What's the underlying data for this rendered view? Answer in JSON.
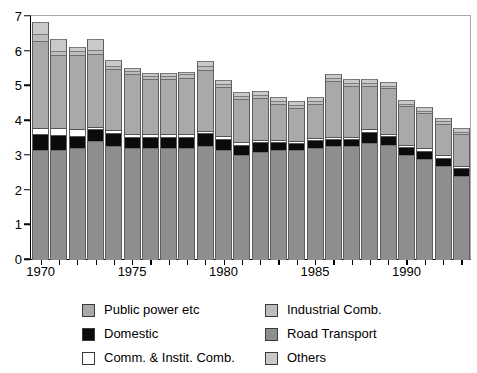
{
  "chart_data": {
    "type": "bar",
    "stacked": true,
    "title": "",
    "subtitle": "",
    "xlabel": "",
    "ylabel": "",
    "ylim": [
      0,
      7
    ],
    "yticks": [
      0,
      1,
      2,
      3,
      4,
      5,
      6,
      7
    ],
    "ytick_labels": [
      "0",
      "1",
      "2",
      "3",
      "4",
      "5",
      "6",
      "7"
    ],
    "grid": false,
    "legend_position": "bottom",
    "categories": [
      1970,
      1971,
      1972,
      1973,
      1974,
      1975,
      1976,
      1977,
      1978,
      1979,
      1980,
      1981,
      1982,
      1983,
      1984,
      1985,
      1986,
      1987,
      1988,
      1989,
      1990,
      1991,
      1992,
      1993
    ],
    "xtick_labels": [
      "1970",
      "1975",
      "1980",
      "1985",
      "1990"
    ],
    "xtick_label_years": [
      1970,
      1975,
      1980,
      1985,
      1990
    ],
    "stack_order_bottom_to_top": [
      "Road Transport",
      "Domestic",
      "Comm. & Instit. Comb.",
      "Public power etc",
      "Industrial Comb.",
      "Others"
    ],
    "series": [
      {
        "name": "Road Transport",
        "color": "#8e8e8e",
        "values": [
          3.15,
          3.15,
          3.2,
          3.4,
          3.25,
          3.2,
          3.2,
          3.2,
          3.2,
          3.25,
          3.15,
          3.0,
          3.1,
          3.15,
          3.15,
          3.2,
          3.25,
          3.25,
          3.35,
          3.3,
          3.0,
          2.9,
          2.7,
          2.4
        ]
      },
      {
        "name": "Domestic",
        "color": "#0b0b0b",
        "values": [
          0.42,
          0.4,
          0.32,
          0.32,
          0.35,
          0.3,
          0.28,
          0.28,
          0.3,
          0.35,
          0.28,
          0.25,
          0.25,
          0.2,
          0.18,
          0.2,
          0.2,
          0.2,
          0.3,
          0.22,
          0.2,
          0.2,
          0.2,
          0.2
        ]
      },
      {
        "name": "Comm. & Instit. Comb.",
        "color": "#ffffff",
        "values": [
          0.22,
          0.22,
          0.22,
          0.1,
          0.12,
          0.12,
          0.12,
          0.12,
          0.12,
          0.1,
          0.12,
          0.12,
          0.1,
          0.08,
          0.08,
          0.08,
          0.08,
          0.08,
          0.1,
          0.1,
          0.1,
          0.1,
          0.1,
          0.1
        ]
      },
      {
        "name": "Public power etc",
        "color": "#a9a9a9",
        "values": [
          2.5,
          2.1,
          2.15,
          2.1,
          1.75,
          1.7,
          1.6,
          1.6,
          1.6,
          1.75,
          1.4,
          1.25,
          1.2,
          1.05,
          0.95,
          1.0,
          1.6,
          1.45,
          1.25,
          1.3,
          1.1,
          1.0,
          0.9,
          0.9
        ]
      },
      {
        "name": "Industrial Comb.",
        "color": "#bdbdbd",
        "values": [
          0.2,
          0.12,
          0.1,
          0.1,
          0.1,
          0.1,
          0.08,
          0.08,
          0.1,
          0.12,
          0.1,
          0.08,
          0.08,
          0.08,
          0.08,
          0.08,
          0.1,
          0.1,
          0.08,
          0.08,
          0.08,
          0.08,
          0.08,
          0.08
        ]
      },
      {
        "name": "Others",
        "color": "#c9c9c9",
        "values": [
          0.35,
          0.35,
          0.12,
          0.32,
          0.18,
          0.1,
          0.08,
          0.07,
          0.08,
          0.15,
          0.1,
          0.12,
          0.12,
          0.12,
          0.12,
          0.1,
          0.1,
          0.1,
          0.1,
          0.1,
          0.1,
          0.1,
          0.1,
          0.1
        ]
      }
    ],
    "totals": [
      6.84,
      6.34,
      6.11,
      6.34,
      5.75,
      5.52,
      5.36,
      5.35,
      5.4,
      5.72,
      5.15,
      4.82,
      4.85,
      4.68,
      4.56,
      4.66,
      5.33,
      5.18,
      5.18,
      5.1,
      4.58,
      4.38,
      4.08,
      3.78
    ]
  },
  "legend": {
    "items": [
      {
        "label": "Public power etc",
        "color": "#a9a9a9",
        "column": "a",
        "row": 1
      },
      {
        "label": "Industrial Comb.",
        "color": "#bdbdbd",
        "column": "b",
        "row": 1
      },
      {
        "label": "Domestic",
        "color": "#0b0b0b",
        "column": "a",
        "row": 2
      },
      {
        "label": "Road Transport",
        "color": "#8e8e8e",
        "column": "b",
        "row": 2
      },
      {
        "label": "Comm. & Instit. Comb.",
        "color": "#ffffff",
        "column": "a",
        "row": 3
      },
      {
        "label": "Others",
        "color": "#c9c9c9",
        "column": "b",
        "row": 3
      }
    ]
  }
}
